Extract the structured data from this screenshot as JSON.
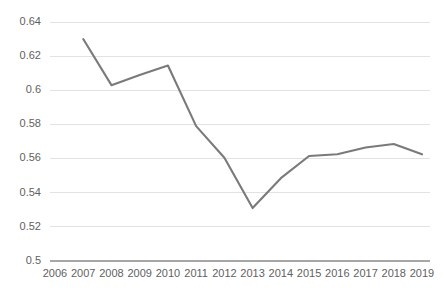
{
  "chart_data": {
    "type": "line",
    "title": "",
    "subtitle": "",
    "xlabel": "",
    "ylabel": "",
    "categories": [
      "2006",
      "2007",
      "2008",
      "2009",
      "2010",
      "2011",
      "2012",
      "2013",
      "2014",
      "2015",
      "2016",
      "2017",
      "2018",
      "2019"
    ],
    "x": [
      2006,
      2007,
      2008,
      2009,
      2010,
      2011,
      2012,
      2013,
      2014,
      2015,
      2016,
      2017,
      2018,
      2019
    ],
    "values": [
      null,
      0.63,
      0.603,
      0.609,
      0.6145,
      0.579,
      0.5605,
      0.531,
      0.5485,
      0.5615,
      0.5625,
      0.5665,
      0.5685,
      0.5625
    ],
    "series": [
      {
        "name": "",
        "color": "#7a7a7a",
        "values": [
          null,
          0.63,
          0.603,
          0.609,
          0.6145,
          0.579,
          0.5605,
          0.531,
          0.5485,
          0.5615,
          0.5625,
          0.5665,
          0.5685,
          0.5625
        ]
      }
    ],
    "ylim": [
      0.5,
      0.64
    ],
    "yticks": [
      0.5,
      0.52,
      0.54,
      0.56,
      0.58,
      0.6,
      0.62,
      0.64
    ],
    "ytick_labels": [
      "0.5",
      "0.52",
      "0.54",
      "0.56",
      "0.58",
      "0.6",
      "0.62",
      "0.64"
    ],
    "xlim": [
      2006,
      2019
    ],
    "grid": true,
    "grid_axis": "y",
    "legend": false,
    "legend_position": "none",
    "annotations": [],
    "markers": false
  },
  "style": {
    "background": "#ffffff",
    "line_color": "#7a7a7a",
    "gridline_color": "#e2e2e2",
    "axis_color": "#a6a6a6",
    "tick_label_color": "#5f5f5f"
  }
}
